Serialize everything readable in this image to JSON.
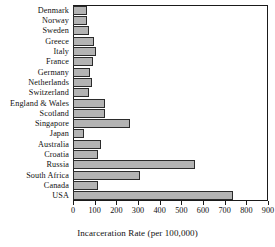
{
  "chart_data": {
    "type": "bar",
    "orientation": "horizontal",
    "title": "",
    "xlabel": "Incarceration Rate (per 100,000)",
    "ylabel": "",
    "xlim": [
      0,
      900
    ],
    "xticks": [
      0,
      100,
      200,
      300,
      400,
      500,
      600,
      700,
      800,
      900
    ],
    "grid": false,
    "legend": null,
    "bar_fill_color": "#b3b3b3",
    "bar_edge_color": "#2b2b2b",
    "categories": [
      "Denmark",
      "Norway",
      "Sweden",
      "Greece",
      "Italy",
      "France",
      "Germany",
      "Netherlands",
      "Switzerland",
      "England & Wales",
      "Scotland",
      "Singapore",
      "Japan",
      "Australia",
      "Croatia",
      "Russia",
      "South Africa",
      "Canada",
      "USA"
    ],
    "values": [
      66,
      65,
      72,
      95,
      105,
      90,
      80,
      88,
      75,
      148,
      148,
      265,
      50,
      130,
      115,
      565,
      310,
      115,
      740
    ]
  }
}
